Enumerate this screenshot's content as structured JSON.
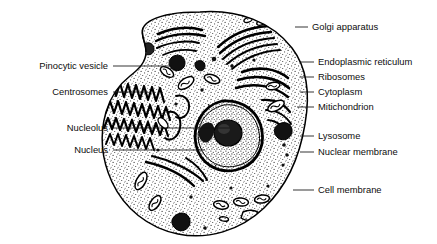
{
  "figure": {
    "background_color": "#ffffff",
    "ink_color": "#111111",
    "width": 437,
    "height": 244
  },
  "cell": {
    "name": "animal-cell",
    "fill": "#f2f2f2",
    "stipple_color": "#3a3a3a",
    "outline_color": "#000000"
  },
  "labels_right": [
    {
      "id": "golgi-apparatus",
      "text": "Golgi apparatus",
      "text_x": 312,
      "text_y": 30,
      "line_x1": 295,
      "line_y1": 27,
      "line_x2": 308,
      "line_y2": 27
    },
    {
      "id": "endoplasmic-reticulum",
      "text": "Endoplasmic reticulum",
      "text_x": 318,
      "text_y": 65,
      "line_x1": 300,
      "line_y1": 62,
      "line_x2": 314,
      "line_y2": 62
    },
    {
      "id": "ribosomes",
      "text": "Ribosomes",
      "text_x": 318,
      "text_y": 80,
      "line_x1": 300,
      "line_y1": 77,
      "line_x2": 314,
      "line_y2": 77
    },
    {
      "id": "cytoplasm",
      "text": "Cytoplasm",
      "text_x": 318,
      "text_y": 95,
      "line_x1": 300,
      "line_y1": 92,
      "line_x2": 314,
      "line_y2": 92
    },
    {
      "id": "mitichondrion",
      "text": "Mitichondrion",
      "text_x": 318,
      "text_y": 110,
      "line_x1": 297,
      "line_y1": 107,
      "line_x2": 314,
      "line_y2": 107
    },
    {
      "id": "lysosome",
      "text": "Lysosome",
      "text_x": 318,
      "text_y": 139,
      "line_x1": 300,
      "line_y1": 136,
      "line_x2": 314,
      "line_y2": 136
    },
    {
      "id": "nuclear-membrane",
      "text": "Nuclear membrane",
      "text_x": 318,
      "text_y": 155,
      "line_x1": 300,
      "line_y1": 152,
      "line_x2": 314,
      "line_y2": 152
    },
    {
      "id": "cell-membrane",
      "text": "Cell membrane",
      "text_x": 318,
      "text_y": 193,
      "line_x1": 293,
      "line_y1": 190,
      "line_x2": 314,
      "line_y2": 190
    }
  ],
  "labels_left": [
    {
      "id": "pinocytic-vesicle",
      "text": "Pinocytic vesicle",
      "text_x": 108,
      "text_y": 69,
      "line_x1": 113,
      "line_y1": 66,
      "line_x2": 172,
      "line_y2": 66
    },
    {
      "id": "centrosomes",
      "text": "Centrosomes",
      "text_x": 108,
      "text_y": 95,
      "line_x1": 113,
      "line_y1": 92,
      "line_x2": 148,
      "line_y2": 92
    },
    {
      "id": "nucleolus",
      "text": "Nucleolus",
      "text_x": 108,
      "text_y": 131,
      "line_x1": 113,
      "line_y1": 128,
      "line_x2": 230,
      "line_y2": 128
    },
    {
      "id": "nucleus",
      "text": "Nucleus",
      "text_x": 108,
      "text_y": 153,
      "line_x1": 113,
      "line_y1": 150,
      "line_x2": 205,
      "line_y2": 150
    }
  ]
}
